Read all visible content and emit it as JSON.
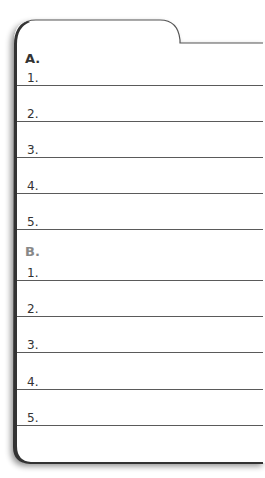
{
  "worksheet": {
    "sections": [
      {
        "heading": "A.",
        "heading_color": "#333333",
        "items": [
          "1.",
          "2.",
          "3.",
          "4.",
          "5."
        ]
      },
      {
        "heading": "B.",
        "heading_color": "#888888",
        "items": [
          "1.",
          "2.",
          "3.",
          "4.",
          "5."
        ]
      }
    ]
  }
}
